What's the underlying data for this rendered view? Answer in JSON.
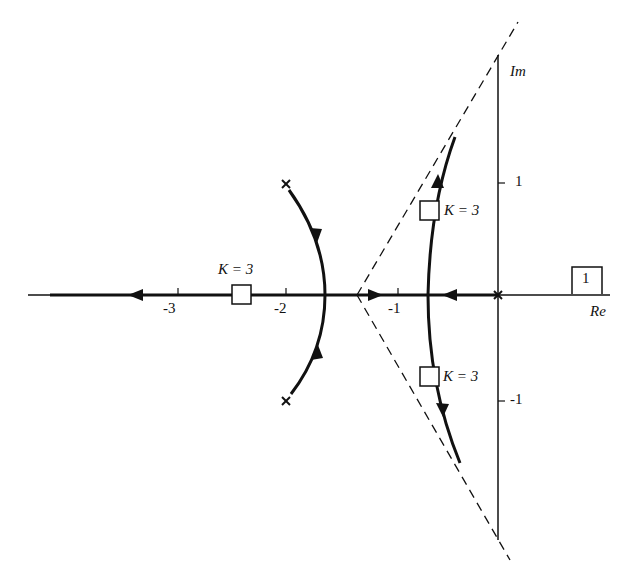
{
  "diagram": {
    "type": "root-locus",
    "axes": {
      "real_label": "Re",
      "imag_label": "Im",
      "real_ticks": [
        "-3",
        "-2",
        "-1"
      ],
      "imag_ticks": [
        "1",
        "-1"
      ]
    },
    "figure_number": "1",
    "gain_labels": [
      {
        "text": "K = 3",
        "location": "real axis near -2.4"
      },
      {
        "text": "K = 3",
        "location": "upper branch near -0.65 + 0.75j"
      },
      {
        "text": "K = 3",
        "location": "lower branch near -0.65 - 0.75j"
      }
    ],
    "poles": [
      {
        "re": 0,
        "im": 0
      },
      {
        "re": -2,
        "im": 1
      },
      {
        "re": -2,
        "im": -1
      }
    ],
    "asymptote_centroid": -1.33,
    "colors": {
      "line": "#111111",
      "background": "#ffffff"
    }
  }
}
